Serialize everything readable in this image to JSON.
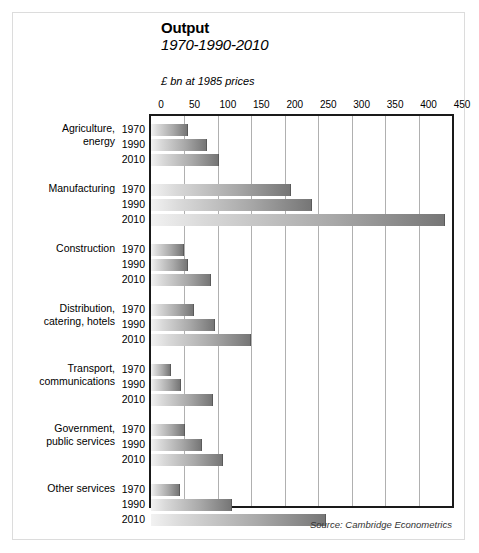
{
  "header": {
    "title": "Output",
    "subtitle": "1970-1990-2010",
    "units": "£ bn at 1985 prices"
  },
  "source": "Source: Cambridge Econometrics",
  "colors": {
    "bar_light": "#f2f2f2",
    "bar_dark": "#767676",
    "bar_edge": "#5a5a5a",
    "plot_border": "#1a1a1a",
    "gridline": "#b0b0b0",
    "card_border": "#dcdcdc",
    "text": "#000000"
  },
  "chart_data": {
    "type": "bar",
    "orientation": "horizontal",
    "title": "Output",
    "subtitle": "1970-1990-2010",
    "xlabel": "£ bn at 1985 prices",
    "ylabel": "",
    "xlim": [
      0,
      450
    ],
    "xticks": [
      0,
      50,
      100,
      150,
      200,
      250,
      300,
      350,
      400,
      450
    ],
    "grid": true,
    "legend": false,
    "legend_position": "none",
    "annotations": [
      "Source: Cambridge Econometrics"
    ],
    "categories": [
      "Agriculture, energy",
      "Manufacturing",
      "Construction",
      "Distribution, catering, hotels",
      "Transport, communications",
      "Government, public services",
      "Other services"
    ],
    "series": [
      {
        "name": "1970",
        "values": [
          55,
          210,
          50,
          65,
          30,
          51,
          43
        ]
      },
      {
        "name": "1990",
        "values": [
          83,
          240,
          56,
          95,
          45,
          76,
          121
        ]
      },
      {
        "name": "2010",
        "values": [
          101,
          440,
          89,
          149,
          93,
          108,
          262
        ]
      }
    ]
  },
  "groups": [
    {
      "label_lines": [
        "Agriculture,",
        "energy"
      ],
      "bars": [
        {
          "year": "1970",
          "value": 55
        },
        {
          "year": "1990",
          "value": 83
        },
        {
          "year": "2010",
          "value": 101
        }
      ]
    },
    {
      "label_lines": [
        "Manufacturing"
      ],
      "bars": [
        {
          "year": "1970",
          "value": 210
        },
        {
          "year": "1990",
          "value": 240
        },
        {
          "year": "2010",
          "value": 440
        }
      ]
    },
    {
      "label_lines": [
        "Construction"
      ],
      "bars": [
        {
          "year": "1970",
          "value": 50
        },
        {
          "year": "1990",
          "value": 56
        },
        {
          "year": "2010",
          "value": 89
        }
      ]
    },
    {
      "label_lines": [
        "Distribution,",
        "catering, hotels"
      ],
      "bars": [
        {
          "year": "1970",
          "value": 65
        },
        {
          "year": "1990",
          "value": 95
        },
        {
          "year": "2010",
          "value": 149
        }
      ]
    },
    {
      "label_lines": [
        "Transport,",
        "communications"
      ],
      "bars": [
        {
          "year": "1970",
          "value": 30
        },
        {
          "year": "1990",
          "value": 45
        },
        {
          "year": "2010",
          "value": 93
        }
      ]
    },
    {
      "label_lines": [
        "Government,",
        "public services"
      ],
      "bars": [
        {
          "year": "1970",
          "value": 51
        },
        {
          "year": "1990",
          "value": 76
        },
        {
          "year": "2010",
          "value": 108
        }
      ]
    },
    {
      "label_lines": [
        "Other services"
      ],
      "bars": [
        {
          "year": "1970",
          "value": 43
        },
        {
          "year": "1990",
          "value": 121
        },
        {
          "year": "2010",
          "value": 262
        }
      ]
    }
  ]
}
